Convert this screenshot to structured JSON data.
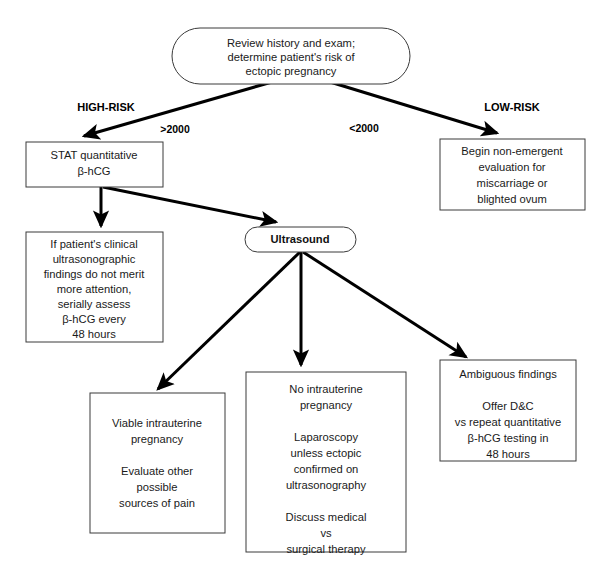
{
  "diagram": {
    "colors": {
      "node_fill": "#ffffff",
      "node_stroke": "#3a3a3a",
      "edge_stroke": "#000000",
      "text": "#1a1a1a"
    },
    "nodes": {
      "root": {
        "id": "review-history",
        "shape": "stadium",
        "lines": [
          "Review  history and exam;",
          "determine patient's risk of",
          "ectopic pregnancy"
        ]
      },
      "stat_hcg": {
        "id": "stat-quantitative-hcg",
        "shape": "rect",
        "lines": [
          "STAT quantitative",
          "β-hCG"
        ]
      },
      "non_emergent": {
        "id": "begin-non-emergent-evaluation",
        "shape": "rect",
        "lines": [
          "Begin non-emergent",
          "evaluation for",
          "miscarriage or",
          "blighted ovum"
        ]
      },
      "serial_hcg": {
        "id": "serially-assess-hcg",
        "shape": "rect",
        "lines": [
          "If patient's clinical",
          "ultrasonographic",
          "findings do not merit",
          "more attention,",
          "serially assess",
          "β-hCG every",
          "48 hours"
        ]
      },
      "ultrasound": {
        "id": "ultrasound",
        "shape": "stadium",
        "lines": [
          "Ultrasound"
        ]
      },
      "viable": {
        "id": "viable-intrauterine-pregnancy",
        "shape": "rect",
        "lines": [
          "Viable intrauterine",
          "pregnancy",
          "",
          "Evaluate other",
          "possible",
          "sources of pain"
        ]
      },
      "no_iup": {
        "id": "no-intrauterine-pregnancy",
        "shape": "rect",
        "lines": [
          "No intrauterine",
          "pregnancy",
          "",
          "Laparoscopy",
          "unless ectopic",
          "confirmed on",
          "ultrasonography",
          "",
          "Discuss medical",
          "vs",
          "surgical therapy"
        ]
      },
      "ambiguous": {
        "id": "ambiguous-findings",
        "shape": "rect",
        "lines": [
          "Ambiguous findings",
          "",
          "Offer D&C",
          "vs repeat quantitative",
          "β-hCG testing in",
          "48 hours"
        ]
      }
    },
    "annotations": {
      "high_risk": "HIGH-RISK",
      "low_risk": "LOW-RISK",
      "edge_gt_2000": ">2000",
      "edge_lt_2000": "<2000"
    },
    "edges": [
      {
        "from": "review-history",
        "to": "stat-quantitative-hcg",
        "label": ">2000"
      },
      {
        "from": "review-history",
        "to": "begin-non-emergent-evaluation",
        "label": "<2000"
      },
      {
        "from": "stat-quantitative-hcg",
        "to": "serially-assess-hcg",
        "label": ""
      },
      {
        "from": "stat-quantitative-hcg",
        "to": "ultrasound",
        "label": ""
      },
      {
        "from": "ultrasound",
        "to": "viable-intrauterine-pregnancy",
        "label": ""
      },
      {
        "from": "ultrasound",
        "to": "no-intrauterine-pregnancy",
        "label": ""
      },
      {
        "from": "ultrasound",
        "to": "ambiguous-findings",
        "label": ""
      }
    ]
  }
}
